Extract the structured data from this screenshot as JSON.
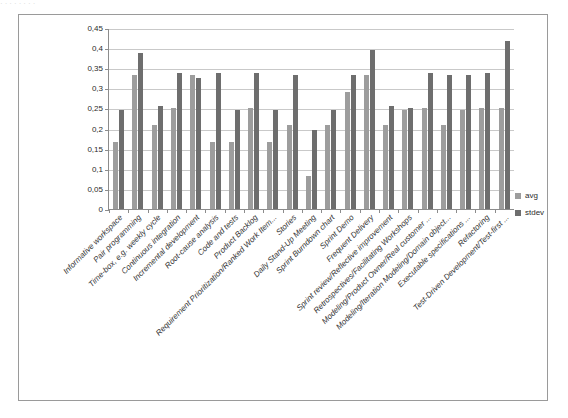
{
  "frame": {
    "border_color": "#9a9a9a",
    "background": "#ffffff"
  },
  "scan_artifacts": {
    "top_noise": "·                    ·                                   ·   ·    ·  ·  ·                ·"
  },
  "legend": {
    "position": "right",
    "entries": [
      {
        "label": "avg",
        "color": "#9d9d9d"
      },
      {
        "label": "stdev",
        "color": "#6e6e6e"
      }
    ]
  },
  "axis": {
    "y_ticks": [
      "0",
      "0,05",
      "0,1",
      "0,15",
      "0,2",
      "0,25",
      "0,3",
      "0,35",
      "0,4",
      "0,45"
    ]
  },
  "chart_data": {
    "type": "bar",
    "title": "",
    "subtitle": "",
    "xlabel": "",
    "ylabel": "",
    "ylim": [
      0,
      0.45
    ],
    "ytick_step": 0.05,
    "grid": true,
    "legend_position": "right",
    "orientation": "vertical",
    "grouping": "grouped",
    "categories": [
      "Informative workspace",
      "Pair programming",
      "Time-box, e.g. weekly cycle",
      "Continuous integration",
      "Incremental development",
      "Root-cause analysis",
      "Code and tests",
      "Product Backlog",
      "Requirement Prioritization/Ranked Work Item...",
      "Stories",
      "Daily Stand-Up Meeting",
      "Sprint Burndown chart",
      "Sprint Demo",
      "Frequent Delivery",
      "Sprint review/Reflective improvement",
      "Retrospectives/Facilitating Workshops",
      "Modeling/Product Owner/Real customer ...",
      "Modeling/Iteration Modeling/Domain object...",
      "Executable specifications ...",
      "Refactoring",
      "Test-Driven Development/Test-first ..."
    ],
    "series": [
      {
        "name": "avg",
        "color": "#9d9d9d",
        "values": [
          0.167,
          0.333,
          0.208,
          0.25,
          0.333,
          0.167,
          0.167,
          0.25,
          0.167,
          0.208,
          0.083,
          0.208,
          0.292,
          0.333,
          0.208,
          0.246,
          0.25,
          0.208,
          0.246,
          0.25,
          0.25
        ]
      },
      {
        "name": "stdev",
        "color": "#6e6e6e",
        "values": [
          0.246,
          0.389,
          0.256,
          0.337,
          0.325,
          0.337,
          0.246,
          0.337,
          0.246,
          0.333,
          0.196,
          0.246,
          0.333,
          0.396,
          0.256,
          0.25,
          0.337,
          0.333,
          0.333,
          0.337,
          0.417
        ]
      }
    ]
  }
}
